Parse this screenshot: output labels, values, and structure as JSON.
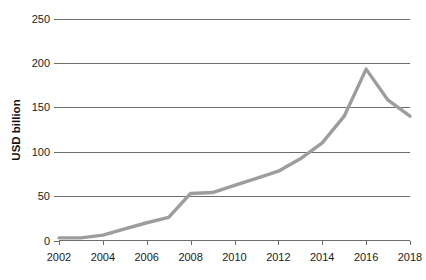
{
  "chart_data": {
    "type": "line",
    "title": "",
    "subtitle": "",
    "xlabel": "",
    "ylabel": "USD billion",
    "xlim": [
      2002,
      2018
    ],
    "ylim": [
      0,
      250
    ],
    "ytick_values": [
      0,
      50,
      100,
      150,
      200,
      250
    ],
    "ytick_labels": [
      "0",
      "50",
      "100",
      "150",
      "200",
      "250"
    ],
    "xtick_values": [
      2002,
      2004,
      2006,
      2008,
      2010,
      2012,
      2014,
      2016,
      2018
    ],
    "xtick_labels": [
      "2002",
      "2004",
      "2006",
      "2008",
      "2010",
      "2012",
      "2014",
      "2016",
      "2018"
    ],
    "grid": true,
    "grid_axis": "y",
    "legend": false,
    "legend_position": "none",
    "line_color": "#9d9d9d",
    "line_width": 3.4,
    "axis_color": "#6d6d6d",
    "background_color": "#ffffff",
    "text_color": "#1b1b1b",
    "x": [
      2002,
      2003,
      2004,
      2005,
      2006,
      2007,
      2008,
      2009,
      2010,
      2011,
      2012,
      2013,
      2014,
      2015,
      2016,
      2017,
      2018
    ],
    "series": [
      {
        "name": "USD billion",
        "values": [
          3,
          3,
          6,
          13,
          20,
          26,
          53,
          54,
          62,
          70,
          78,
          92,
          110,
          140,
          193,
          158,
          140
        ]
      }
    ]
  },
  "annotations": {
    "peak_year": "2016",
    "peak_value": "193",
    "plateau_years": "2008-2009",
    "plateau_value": "53"
  }
}
